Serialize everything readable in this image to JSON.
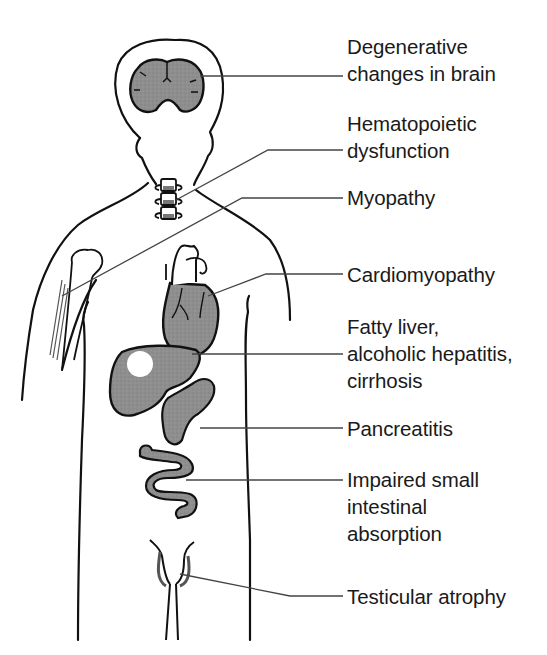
{
  "figure": {
    "colors": {
      "outline": "#111111",
      "organ_fill": "#8c8c8c",
      "leader_line": "#444444",
      "text": "#1a1a1a",
      "background": "#ffffff"
    },
    "labels": [
      {
        "id": "brain",
        "text": "Degenerative\nchanges in brain",
        "organ": "brain"
      },
      {
        "id": "spine",
        "text": "Hematopoietic\ndysfunction",
        "organ": "vertebrae / bone marrow"
      },
      {
        "id": "muscle",
        "text": "Myopathy",
        "organ": "arm muscle"
      },
      {
        "id": "heart",
        "text": "Cardiomyopathy",
        "organ": "heart"
      },
      {
        "id": "liver",
        "text": "Fatty liver,\nalcoholic hepatitis,\ncirrhosis",
        "organ": "liver"
      },
      {
        "id": "pancreas",
        "text": "Pancreatitis",
        "organ": "pancreas"
      },
      {
        "id": "intestine",
        "text": "Impaired small\nintestinal\nabsorption",
        "organ": "small intestine"
      },
      {
        "id": "testes",
        "text": "Testicular atrophy",
        "organ": "testes"
      }
    ]
  }
}
